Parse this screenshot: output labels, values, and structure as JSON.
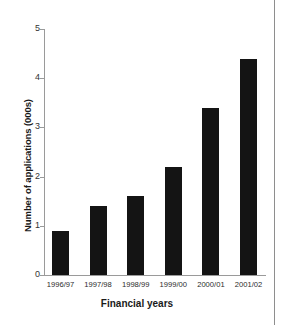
{
  "chart_data": {
    "type": "bar",
    "title": "",
    "subtitle": "",
    "xlabel": "Financial years",
    "ylabel": "Number of applications (000s)",
    "categories": [
      "1996/97",
      "1997/98",
      "1998/99",
      "1999/00",
      "2000/01",
      "2001/02"
    ],
    "values": [
      0.9,
      1.4,
      1.6,
      2.2,
      3.4,
      4.4
    ],
    "ylim": [
      0,
      5
    ],
    "ytick_values": [
      0,
      1,
      2,
      3,
      4,
      5
    ],
    "ytick_labels": [
      "0",
      "1",
      "2",
      "3",
      "4",
      "5"
    ],
    "grid": false,
    "legend": null,
    "bar_color": "#141414",
    "axis_color": "#9a9a9a",
    "background_color": "#ffffff"
  }
}
